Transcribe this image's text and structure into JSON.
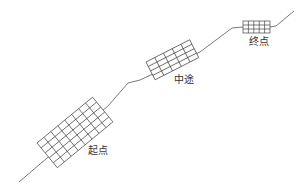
{
  "diagram": {
    "type": "route-with-grids",
    "labels": {
      "start": "起点",
      "middle": "中途",
      "end": "终点"
    },
    "stroke_color": "#444444",
    "grids": [
      {
        "name": "start",
        "cols": 8,
        "rows": 5
      },
      {
        "name": "middle",
        "cols": 5,
        "rows": 4
      },
      {
        "name": "end",
        "cols": 5,
        "rows": 3
      }
    ]
  }
}
